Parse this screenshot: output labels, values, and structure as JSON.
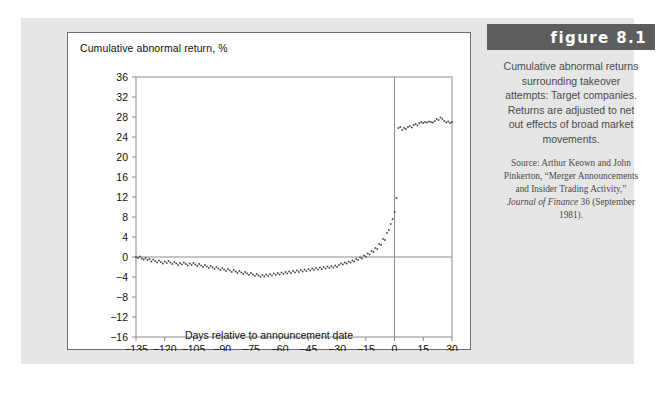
{
  "figure": {
    "number_label": "figure 8.1",
    "caption": "Cumulative abnormal returns surrounding takeover attempts: Target companies. Returns are adjusted to net out effects of broad market movements.",
    "source_prefix": "Source: Arthur Keown and John Pinkerton, “Merger Announcements and Insider Trading Activity,” ",
    "source_italic": "Journal of Finance",
    "source_suffix": " 36 (September 1981)."
  },
  "colors": {
    "page_background": "#ffffff",
    "panel_background": "#e6e6e6",
    "card_background": "#ffffff",
    "card_border": "#6e6e6e",
    "banner_background": "#5d5d5d",
    "banner_text": "#ffffff",
    "axis": "#8a8a8a",
    "marker": "#3a3a3a",
    "caption_text": "#4a4a4a",
    "tick_text": "#111111"
  },
  "chart_data": {
    "type": "scatter",
    "title": "",
    "xlabel": "Days relative to announcement date",
    "ylabel": "Cumulative abnormal return, %",
    "xlim": [
      -135,
      30
    ],
    "ylim": [
      -16,
      36
    ],
    "xticks": [
      -135,
      -120,
      -105,
      -90,
      -75,
      -60,
      -45,
      -30,
      -15,
      0,
      15,
      30
    ],
    "xticklabels": [
      "−135",
      "−120",
      "−105",
      "−90",
      "−75",
      "−60",
      "−45",
      "−30",
      "−15",
      "0",
      "15",
      "30"
    ],
    "yticks": [
      -16,
      -12,
      -8,
      -4,
      0,
      4,
      8,
      12,
      16,
      20,
      24,
      28,
      32,
      36
    ],
    "yticklabels": [
      "−16",
      "−12",
      "−8",
      "−4",
      "0",
      "4",
      "8",
      "12",
      "16",
      "20",
      "24",
      "28",
      "32",
      "36"
    ],
    "grid": false,
    "legend": false,
    "zero_line_y": 0,
    "announcement_line_x": 0,
    "marker_size": 1.6,
    "x": [
      -135,
      -134,
      -133,
      -132,
      -131,
      -130,
      -129,
      -128,
      -127,
      -126,
      -125,
      -124,
      -123,
      -122,
      -121,
      -120,
      -119,
      -118,
      -117,
      -116,
      -115,
      -114,
      -113,
      -112,
      -111,
      -110,
      -109,
      -108,
      -107,
      -106,
      -105,
      -104,
      -103,
      -102,
      -101,
      -100,
      -99,
      -98,
      -97,
      -96,
      -95,
      -94,
      -93,
      -92,
      -91,
      -90,
      -89,
      -88,
      -87,
      -86,
      -85,
      -84,
      -83,
      -82,
      -81,
      -80,
      -79,
      -78,
      -77,
      -76,
      -75,
      -74,
      -73,
      -72,
      -71,
      -70,
      -69,
      -68,
      -67,
      -66,
      -65,
      -64,
      -63,
      -62,
      -61,
      -60,
      -59,
      -58,
      -57,
      -56,
      -55,
      -54,
      -53,
      -52,
      -51,
      -50,
      -49,
      -48,
      -47,
      -46,
      -45,
      -44,
      -43,
      -42,
      -41,
      -40,
      -39,
      -38,
      -37,
      -36,
      -35,
      -34,
      -33,
      -32,
      -31,
      -30,
      -29,
      -28,
      -27,
      -26,
      -25,
      -24,
      -23,
      -22,
      -21,
      -20,
      -19,
      -18,
      -17,
      -16,
      -15,
      -14,
      -13,
      -12,
      -11,
      -10,
      -9,
      -8,
      -7,
      -6,
      -5,
      -4,
      -3,
      -2,
      -1,
      0,
      1,
      2,
      3,
      4,
      5,
      6,
      7,
      8,
      9,
      10,
      11,
      12,
      13,
      14,
      15,
      16,
      17,
      18,
      19,
      20,
      21,
      22,
      23,
      24,
      25,
      26,
      27,
      28,
      29,
      30
    ],
    "y": [
      0.0,
      -0.2,
      0.1,
      -0.3,
      -0.5,
      -0.2,
      -0.6,
      -0.4,
      -0.9,
      -0.5,
      -0.8,
      -1.1,
      -0.7,
      -1.0,
      -1.3,
      -0.9,
      -1.2,
      -0.8,
      -1.1,
      -1.4,
      -1.0,
      -1.3,
      -1.6,
      -1.2,
      -1.5,
      -1.1,
      -1.4,
      -1.7,
      -1.3,
      -1.6,
      -1.2,
      -1.5,
      -1.8,
      -1.4,
      -1.7,
      -2.0,
      -1.6,
      -1.9,
      -2.2,
      -1.8,
      -2.1,
      -2.4,
      -2.0,
      -2.3,
      -2.6,
      -2.2,
      -2.5,
      -2.8,
      -2.4,
      -2.7,
      -3.0,
      -2.6,
      -2.9,
      -3.2,
      -2.8,
      -3.1,
      -3.4,
      -3.0,
      -3.3,
      -3.6,
      -3.2,
      -3.5,
      -3.8,
      -3.4,
      -3.7,
      -4.0,
      -3.6,
      -3.9,
      -3.5,
      -3.8,
      -3.4,
      -3.7,
      -3.3,
      -3.6,
      -3.2,
      -3.5,
      -3.1,
      -3.4,
      -3.0,
      -3.3,
      -2.9,
      -3.2,
      -2.8,
      -3.1,
      -2.7,
      -3.0,
      -2.6,
      -2.9,
      -2.5,
      -2.8,
      -2.4,
      -2.7,
      -2.3,
      -2.6,
      -2.2,
      -2.5,
      -2.1,
      -2.4,
      -2.0,
      -2.3,
      -1.9,
      -2.2,
      -1.8,
      -2.1,
      -1.7,
      -2.0,
      -1.6,
      -1.3,
      -1.5,
      -1.1,
      -1.3,
      -0.9,
      -1.1,
      -0.7,
      -0.9,
      -0.4,
      -0.6,
      -0.1,
      -0.3,
      0.3,
      0.1,
      0.7,
      0.5,
      1.2,
      1.0,
      1.8,
      1.6,
      2.6,
      2.4,
      3.6,
      3.4,
      4.8,
      5.4,
      6.6,
      7.6,
      9.0,
      11.8,
      25.8,
      26.0,
      25.4,
      25.8,
      25.6,
      26.0,
      26.2,
      25.9,
      26.4,
      26.6,
      26.3,
      26.8,
      27.0,
      26.8,
      27.0,
      26.9,
      27.1,
      27.0,
      26.9,
      27.2,
      27.6,
      27.4,
      27.9,
      27.6,
      27.2,
      26.9,
      27.1,
      26.8,
      27.0,
      26.8,
      27.0
    ]
  }
}
